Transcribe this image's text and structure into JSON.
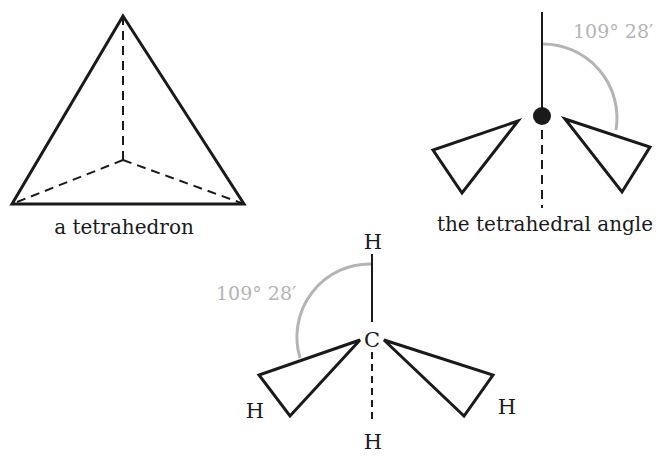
{
  "colors": {
    "line": "#1a1a1a",
    "angle_arc": "#b4b4b4",
    "background": "#ffffff"
  },
  "tetrahedron": {
    "caption": "a tetrahedron"
  },
  "tetrahedral_angle": {
    "caption": "the tetrahedral angle",
    "angle_label": "109° 28′"
  },
  "methane": {
    "center_atom": "C",
    "top_atom": "H",
    "left_atom": "H",
    "right_atom": "H",
    "bottom_atom": "H",
    "angle_label": "109° 28′"
  }
}
